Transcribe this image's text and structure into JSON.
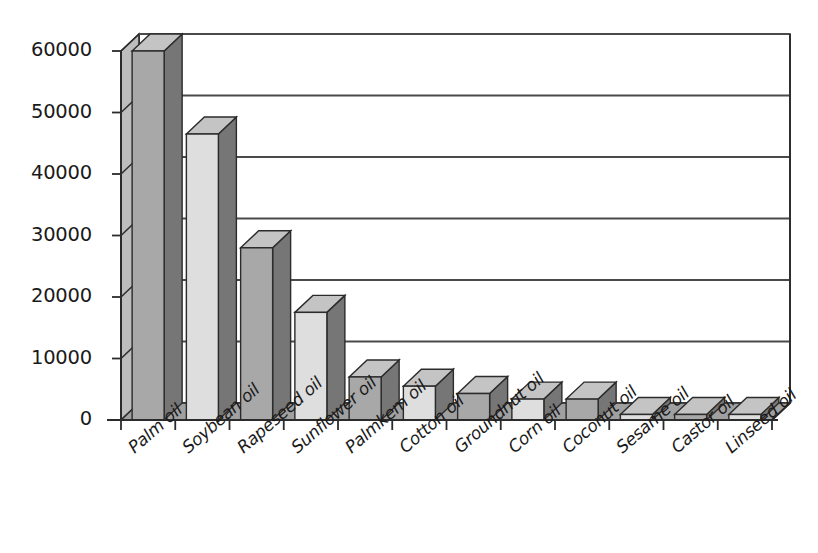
{
  "chart_data": {
    "type": "bar",
    "title": "",
    "subtitle": "",
    "xlabel": "",
    "ylabel": "",
    "style": "3d-column",
    "grid": true,
    "legend": false,
    "legend_position": "none",
    "ylim": [
      0,
      60000
    ],
    "ytick_labels": [
      "0",
      "10000",
      "20000",
      "30000",
      "40000",
      "50000",
      "60000"
    ],
    "ytick_values": [
      0,
      10000,
      20000,
      30000,
      40000,
      50000,
      60000
    ],
    "categories": [
      "Palm oil",
      "Soybean oil",
      "Rapeseed oil",
      "Sunflower oil",
      "Palmkem oil",
      "Cotton oil",
      "Groundnut oil",
      "Corn oil",
      "Coconut oil",
      "Sesame oil",
      "Castor oil",
      "Linseed oil"
    ],
    "values": [
      60000,
      46500,
      28000,
      17500,
      7000,
      5500,
      4300,
      3400,
      3400,
      900,
      900,
      900
    ],
    "series": [
      {
        "name": "Production",
        "values": [
          60000,
          46500,
          28000,
          17500,
          7000,
          5500,
          4300,
          3400,
          3400,
          900,
          900,
          900
        ]
      }
    ],
    "colors": {
      "bar_dark_front": "#a8a8a8",
      "bar_light_front": "#dedede",
      "bar_top": "#c4c4c4",
      "bar_side": "#767676",
      "floor": "#a0a0a0",
      "wall": "#bdbdbd",
      "axis": "#2b2b2b",
      "gridline": "#4a4a4a",
      "text": "#1a1a1a",
      "background": "#ffffff"
    }
  }
}
